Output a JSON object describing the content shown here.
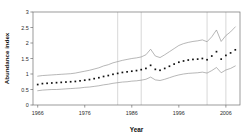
{
  "chart_data": {
    "type": "line",
    "title": "",
    "subtitle": "",
    "xlabel": "Year",
    "ylabel": "Abundance index",
    "xlim": [
      1965,
      2009
    ],
    "ylim": [
      0,
      3
    ],
    "grid": "vertical-only",
    "legend": "none",
    "x_ticks": [
      1966,
      1976,
      1986,
      1996,
      2006
    ],
    "x_tick_labels": [
      "1966",
      "1976",
      "1986",
      "1996",
      "2006"
    ],
    "y_ticks": [
      0,
      0.5,
      1,
      1.5,
      2,
      2.5,
      3
    ],
    "y_tick_labels": [
      "0",
      "0.5",
      "1",
      "1.5",
      "2",
      "2.5",
      "3"
    ],
    "vertical_gridlines_at": [
      1983,
      1988,
      2002,
      2006
    ],
    "x": [
      1966,
      1967,
      1968,
      1969,
      1970,
      1971,
      1972,
      1973,
      1974,
      1975,
      1976,
      1977,
      1978,
      1979,
      1980,
      1981,
      1982,
      1983,
      1984,
      1985,
      1986,
      1987,
      1988,
      1989,
      1990,
      1991,
      1992,
      1993,
      1994,
      1995,
      1996,
      1997,
      1998,
      1999,
      2000,
      2001,
      2002,
      2003,
      2004,
      2005,
      2006,
      2007,
      2008
    ],
    "series": [
      {
        "name": "Abundance index (point estimate)",
        "style": "dotted-markers",
        "values": [
          0.66,
          0.69,
          0.7,
          0.71,
          0.72,
          0.73,
          0.74,
          0.75,
          0.76,
          0.78,
          0.8,
          0.82,
          0.85,
          0.88,
          0.92,
          0.95,
          0.99,
          1.02,
          1.05,
          1.07,
          1.09,
          1.11,
          1.14,
          1.18,
          1.28,
          1.15,
          1.12,
          1.18,
          1.25,
          1.32,
          1.38,
          1.42,
          1.45,
          1.47,
          1.48,
          1.5,
          1.46,
          1.58,
          1.72,
          1.48,
          1.6,
          1.68,
          1.78
        ]
      },
      {
        "name": "Upper confidence limit",
        "style": "line",
        "values": [
          0.93,
          0.95,
          0.96,
          0.97,
          0.98,
          0.99,
          1.0,
          1.01,
          1.03,
          1.06,
          1.09,
          1.12,
          1.16,
          1.2,
          1.26,
          1.3,
          1.36,
          1.4,
          1.44,
          1.47,
          1.5,
          1.52,
          1.55,
          1.62,
          1.8,
          1.58,
          1.53,
          1.62,
          1.72,
          1.82,
          1.92,
          1.98,
          2.02,
          2.05,
          2.07,
          2.1,
          2.04,
          2.2,
          2.42,
          2.05,
          2.24,
          2.36,
          2.52
        ]
      },
      {
        "name": "Lower confidence limit",
        "style": "line",
        "values": [
          0.46,
          0.48,
          0.49,
          0.5,
          0.5,
          0.51,
          0.52,
          0.53,
          0.54,
          0.55,
          0.57,
          0.58,
          0.6,
          0.62,
          0.65,
          0.67,
          0.7,
          0.72,
          0.74,
          0.75,
          0.77,
          0.78,
          0.8,
          0.83,
          0.9,
          0.81,
          0.79,
          0.83,
          0.88,
          0.93,
          0.97,
          1.0,
          1.02,
          1.03,
          1.04,
          1.06,
          1.03,
          1.11,
          1.21,
          1.04,
          1.13,
          1.18,
          1.26
        ]
      }
    ]
  }
}
